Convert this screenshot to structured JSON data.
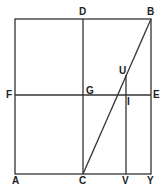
{
  "diagram": {
    "type": "geometric-figure",
    "line_color": "#333333",
    "labels": {
      "A": "A",
      "B": "B",
      "C": "C",
      "D": "D",
      "E": "E",
      "F": "F",
      "G": "G",
      "I": "I",
      "U": "U",
      "V": "V",
      "Y": "Y"
    },
    "points": {
      "A": [
        15,
        174
      ],
      "B": [
        151,
        19
      ],
      "C": [
        83,
        174
      ],
      "D": [
        83,
        19
      ],
      "E": [
        151,
        95
      ],
      "F": [
        15,
        95
      ],
      "G": [
        83,
        95
      ],
      "I": [
        126,
        95
      ],
      "U": [
        126,
        75
      ],
      "V": [
        126,
        174
      ],
      "Y": [
        151,
        174
      ]
    },
    "segments": [
      [
        "F",
        "E"
      ],
      [
        "A",
        "Y"
      ],
      [
        "F",
        "A"
      ],
      [
        "D",
        "C"
      ],
      [
        "B",
        "Y"
      ],
      [
        "C",
        "B"
      ],
      [
        "U",
        "V"
      ],
      [
        "F",
        "D"
      ],
      [
        "D",
        "B"
      ]
    ]
  }
}
